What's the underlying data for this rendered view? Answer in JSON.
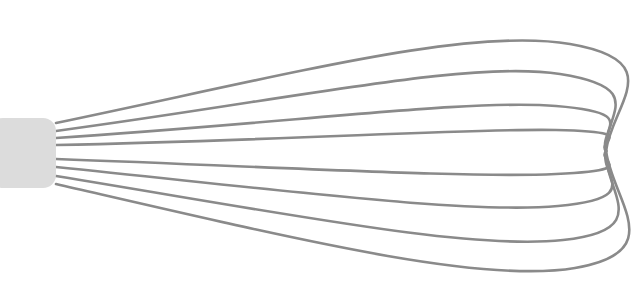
{
  "illustration": {
    "title": "Balloon Whisk",
    "subject": "whisk",
    "style": "line-art",
    "width": 642,
    "height": 303,
    "background_color": "#ffffff"
  },
  "handle": {
    "label": "whisk handle",
    "shape": "rounded-rectangle",
    "fill_color": "#dcdcdc",
    "x": -10,
    "y": 118,
    "width": 66,
    "height": 70,
    "corner_radius": 13
  },
  "wires": {
    "label": "whisk wire loops",
    "count": 8,
    "stroke_color": "#8a8a8a",
    "stroke_width": 2.6,
    "origin": {
      "x": 56,
      "y": 152
    },
    "converge": {
      "x": 606,
      "y": 151
    },
    "loops": [
      {
        "name": "wire-loop-1",
        "position": "outer-top",
        "start": {
          "x": 56,
          "y": 123
        },
        "control1": {
          "x": 300,
          "y": 72
        },
        "control2": {
          "x": 470,
          "y": 27
        },
        "control3": {
          "x": 570,
          "y": 44
        },
        "control4": {
          "x": 612,
          "y": 104
        },
        "end": {
          "x": 606,
          "y": 151
        },
        "apex_y": 29
      },
      {
        "name": "wire-loop-2",
        "position": "upper",
        "start": {
          "x": 56,
          "y": 131
        },
        "control1": {
          "x": 300,
          "y": 98
        },
        "control2": {
          "x": 470,
          "y": 60
        },
        "control3": {
          "x": 560,
          "y": 74
        },
        "control4": {
          "x": 603,
          "y": 116
        },
        "end": {
          "x": 606,
          "y": 151
        },
        "apex_y": 61
      },
      {
        "name": "wire-loop-3",
        "position": "upper-mid",
        "start": {
          "x": 56,
          "y": 138
        },
        "control1": {
          "x": 300,
          "y": 122
        },
        "control2": {
          "x": 470,
          "y": 99
        },
        "control3": {
          "x": 556,
          "y": 106
        },
        "control4": {
          "x": 598,
          "y": 128
        },
        "end": {
          "x": 606,
          "y": 151
        },
        "apex_y": 100
      },
      {
        "name": "wire-loop-4",
        "position": "inner-top",
        "start": {
          "x": 56,
          "y": 145
        },
        "control1": {
          "x": 300,
          "y": 140
        },
        "control2": {
          "x": 470,
          "y": 128
        },
        "control3": {
          "x": 556,
          "y": 130
        },
        "control4": {
          "x": 596,
          "y": 140
        },
        "end": {
          "x": 606,
          "y": 151
        },
        "apex_y": 128
      },
      {
        "name": "wire-loop-5",
        "position": "inner-bottom",
        "start": {
          "x": 56,
          "y": 159
        },
        "control1": {
          "x": 300,
          "y": 168
        },
        "control2": {
          "x": 470,
          "y": 178
        },
        "control3": {
          "x": 556,
          "y": 174
        },
        "control4": {
          "x": 596,
          "y": 162
        },
        "end": {
          "x": 606,
          "y": 151
        },
        "apex_y": 179
      },
      {
        "name": "wire-loop-6",
        "position": "lower-mid",
        "start": {
          "x": 56,
          "y": 167
        },
        "control1": {
          "x": 300,
          "y": 192
        },
        "control2": {
          "x": 470,
          "y": 214
        },
        "control3": {
          "x": 558,
          "y": 206
        },
        "control4": {
          "x": 599,
          "y": 176
        },
        "end": {
          "x": 606,
          "y": 151
        },
        "apex_y": 215
      },
      {
        "name": "wire-loop-7",
        "position": "lower",
        "start": {
          "x": 56,
          "y": 176
        },
        "control1": {
          "x": 300,
          "y": 216
        },
        "control2": {
          "x": 470,
          "y": 250
        },
        "control3": {
          "x": 563,
          "y": 240
        },
        "control4": {
          "x": 604,
          "y": 192
        },
        "end": {
          "x": 606,
          "y": 151
        },
        "apex_y": 251
      },
      {
        "name": "wire-loop-8",
        "position": "outer-bottom",
        "start": {
          "x": 56,
          "y": 184
        },
        "control1": {
          "x": 300,
          "y": 240
        },
        "control2": {
          "x": 480,
          "y": 284
        },
        "control3": {
          "x": 575,
          "y": 268
        },
        "control4": {
          "x": 613,
          "y": 202
        },
        "end": {
          "x": 606,
          "y": 151
        },
        "apex_y": 285
      }
    ]
  }
}
